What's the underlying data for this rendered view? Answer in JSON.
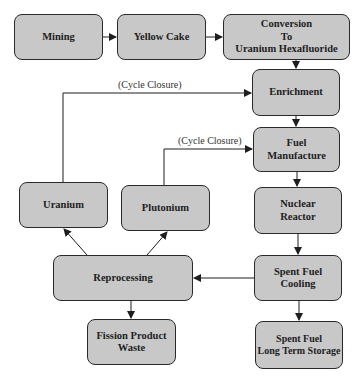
{
  "diagram": {
    "colors": {
      "box_fill": "#c8c8c8",
      "box_border": "#2a2a2a",
      "line": "#1e1e1e",
      "text": "#1e1e1e"
    },
    "nodes": {
      "mining": "Mining",
      "yellow_cake": "Yellow Cake",
      "conversion": "Conversion\nTo\nUranium Hexafluoride",
      "enrichment": "Enrichment",
      "fuel_manufacture": "Fuel\nManufacture",
      "nuclear_reactor": "Nuclear\nReactor",
      "spent_fuel_cooling": "Spent Fuel\nCooling",
      "long_term_storage": "Spent Fuel\nLong Term Storage",
      "reprocessing": "Reprocessing",
      "uranium": "Uranium",
      "plutonium": "Plutonium",
      "fission_waste": "Fission Product\nWaste"
    },
    "labels": {
      "cycle_closure_uranium": "(Cycle Closure)",
      "cycle_closure_plutonium": "(Cycle Closure)"
    },
    "edges": [
      {
        "from": "Mining",
        "to": "Yellow Cake"
      },
      {
        "from": "Yellow Cake",
        "to": "Conversion To Uranium Hexafluoride"
      },
      {
        "from": "Conversion To Uranium Hexafluoride",
        "to": "Enrichment"
      },
      {
        "from": "Enrichment",
        "to": "Fuel Manufacture"
      },
      {
        "from": "Fuel Manufacture",
        "to": "Nuclear Reactor"
      },
      {
        "from": "Nuclear Reactor",
        "to": "Spent Fuel Cooling"
      },
      {
        "from": "Spent Fuel Cooling",
        "to": "Spent Fuel Long Term Storage"
      },
      {
        "from": "Spent Fuel Cooling",
        "to": "Reprocessing"
      },
      {
        "from": "Reprocessing",
        "to": "Uranium"
      },
      {
        "from": "Reprocessing",
        "to": "Plutonium"
      },
      {
        "from": "Reprocessing",
        "to": "Fission Product Waste"
      },
      {
        "from": "Uranium",
        "to": "Enrichment",
        "label": "(Cycle Closure)"
      },
      {
        "from": "Plutonium",
        "to": "Fuel Manufacture",
        "label": "(Cycle Closure)"
      }
    ]
  }
}
